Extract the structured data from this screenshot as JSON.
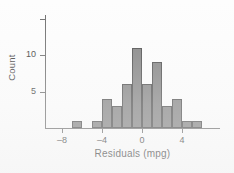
{
  "chart_data": {
    "type": "bar",
    "title": "",
    "xlabel": "Residuals (mpg)",
    "ylabel": "Count",
    "xlim": [
      -9.3,
      -9.3
    ],
    "axis": {
      "x_range": [
        -9.3,
        8.8
      ],
      "y_range": [
        0,
        15.3
      ],
      "grid": false,
      "legend": "none"
    },
    "x_ticks": [
      {
        "value": -8,
        "label": "–8"
      },
      {
        "value": -4,
        "label": "–4"
      },
      {
        "value": 0,
        "label": "0"
      },
      {
        "value": 4,
        "label": "4"
      }
    ],
    "y_ticks": [
      {
        "value": 5,
        "label": "5"
      },
      {
        "value": 10,
        "label": "10"
      },
      {
        "value": 15,
        "label": ""
      }
    ],
    "bin_width": 1,
    "bins": [
      {
        "start": -7,
        "end": -6,
        "count": 1
      },
      {
        "start": -5,
        "end": -4,
        "count": 1
      },
      {
        "start": -4,
        "end": -3,
        "count": 4
      },
      {
        "start": -3,
        "end": -2,
        "count": 3
      },
      {
        "start": -2,
        "end": -1,
        "count": 6
      },
      {
        "start": -1,
        "end": 0,
        "count": 11
      },
      {
        "start": 0,
        "end": 1,
        "count": 6
      },
      {
        "start": 1,
        "end": 2,
        "count": 9
      },
      {
        "start": 2,
        "end": 3,
        "count": 3
      },
      {
        "start": 3,
        "end": 4,
        "count": 4
      },
      {
        "start": 4,
        "end": 5,
        "count": 1
      },
      {
        "start": 5,
        "end": 6,
        "count": 1
      }
    ],
    "categories": [
      "-7",
      "-5",
      "-4",
      "-3",
      "-2",
      "-1",
      "0",
      "1",
      "2",
      "3",
      "4",
      "5"
    ],
    "values": [
      1,
      1,
      4,
      3,
      6,
      11,
      6,
      9,
      3,
      4,
      1,
      1
    ],
    "colors": {
      "bar_fill": "#828282",
      "bar_stroke": "#4a4a4a",
      "axis": "#6e6e6e",
      "text": "#3a3a3a",
      "background": "#fdfdfd"
    }
  }
}
